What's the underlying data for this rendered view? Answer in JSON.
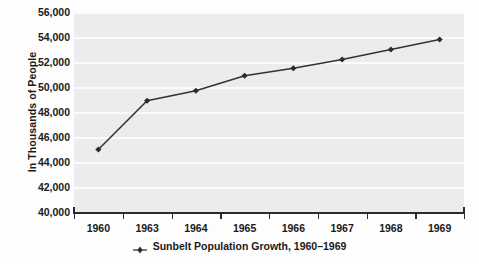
{
  "chart_data": {
    "type": "line",
    "title": "",
    "subtitle": "",
    "xlabel": "",
    "ylabel": "In Thousands of People",
    "categories": [
      "1960",
      "1963",
      "1964",
      "1965",
      "1966",
      "1967",
      "1968",
      "1969"
    ],
    "series": [
      {
        "name": "Sunbelt Population Growth, 1960–1969",
        "values": [
          45000,
          48900,
          49700,
          50900,
          51500,
          52200,
          53000,
          53800
        ]
      }
    ],
    "ylim": [
      40000,
      56000
    ],
    "ytick_step": 2000,
    "ytick_labels": [
      "40,000",
      "42,000",
      "44,000",
      "46,000",
      "48,000",
      "50,000",
      "52,000",
      "54,000",
      "56,000"
    ],
    "ytick_values": [
      40000,
      42000,
      44000,
      46000,
      48000,
      50000,
      52000,
      54000,
      56000
    ],
    "grid": true,
    "grid_color": "#fbfbfb",
    "plot_background": "#ececec",
    "line_color": "#333333",
    "marker_color": "#2b2b2b",
    "marker_shape": "diamond",
    "legend_position": "bottom",
    "legend_label": "Sunbelt Population Growth, 1960–1969"
  }
}
